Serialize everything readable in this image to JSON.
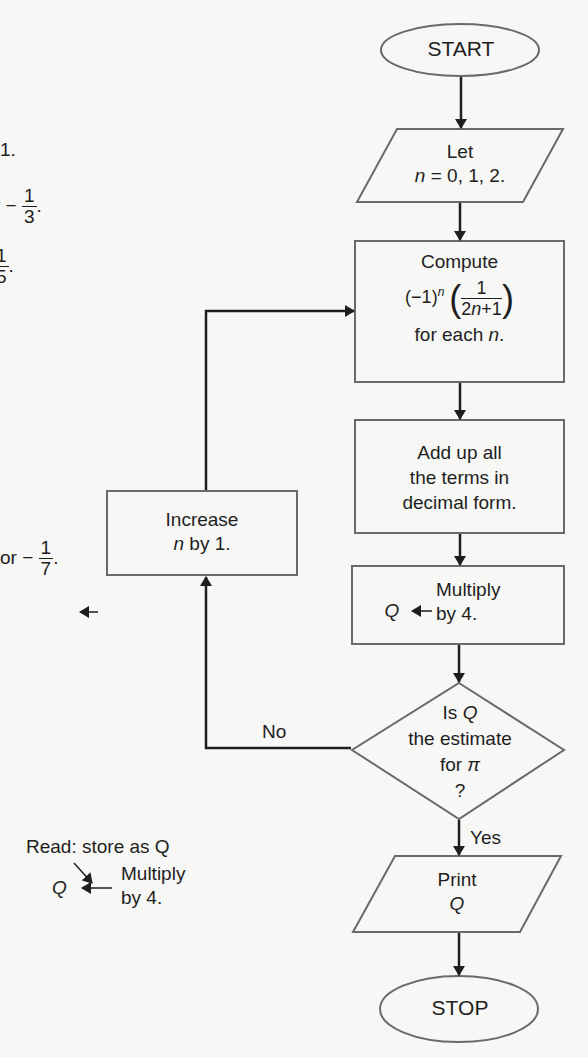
{
  "flowchart": {
    "start": "START",
    "let": {
      "line1": "Let",
      "var": "n",
      "eq": " = 0, 1, 2."
    },
    "compute": {
      "line1": "Compute",
      "prefix": "(−1)",
      "exp": "n",
      "num": "1",
      "den_a": "2",
      "den_var": "n",
      "den_b": "+1",
      "line3a": "for each ",
      "line3var": "n",
      "line3b": "."
    },
    "add": {
      "line1": "Add up all",
      "line2": "the terms in",
      "line3": "decimal form."
    },
    "multiply": {
      "q": "Q",
      "line1": "Multiply",
      "line2": "by 4."
    },
    "decision": {
      "line1a": "Is ",
      "line1q": "Q",
      "line2": "the estimate",
      "line3a": "for ",
      "line3pi": "π",
      "line4": "?"
    },
    "no_label": "No",
    "yes_label": "Yes",
    "increase": {
      "line1": "Increase",
      "var": "n",
      "line2": " by 1."
    },
    "print": {
      "line1": "Print",
      "line2": "Q"
    },
    "stop": "STOP"
  },
  "margin_notes": {
    "note1": "1.",
    "note2_prefix": "r −",
    "note2_num": "1",
    "note2_den": "3",
    "note3_num": "1",
    "note3_den": "5",
    "note4_prefix": "or −",
    "note4_num": "1",
    "note4_den": "7",
    "legend": {
      "read": "Read: store as Q",
      "q": "Q",
      "line1": "Multiply",
      "line2": "by 4."
    }
  }
}
